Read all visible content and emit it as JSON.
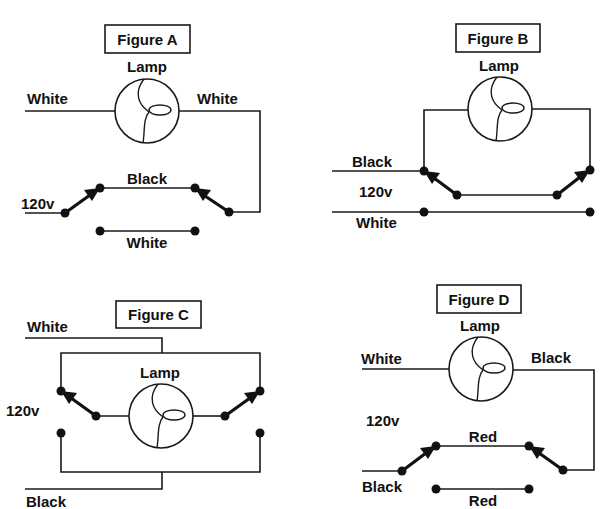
{
  "diagram": {
    "colors": {
      "line": "#1a1a1a",
      "background": "#ffffff"
    },
    "figures": [
      {
        "id": "A",
        "title": "Figure A",
        "lamp_label": "Lamp",
        "labels": {
          "left_top": "White",
          "right_top": "White",
          "top_traveler": "Black",
          "bottom_traveler": "White",
          "supply": "120v"
        }
      },
      {
        "id": "B",
        "title": "Figure B",
        "lamp_label": "Lamp",
        "labels": {
          "hot": "Black",
          "supply": "120v",
          "neutral": "White"
        }
      },
      {
        "id": "C",
        "title": "Figure C",
        "lamp_label": "Lamp",
        "labels": {
          "neutral": "White",
          "supply": "120v",
          "hot": "Black"
        }
      },
      {
        "id": "D",
        "title": "Figure D",
        "lamp_label": "Lamp",
        "labels": {
          "left_top": "White",
          "right_top": "Black",
          "supply": "120v",
          "top_traveler": "Red",
          "hot": "Black",
          "bottom_traveler": "Red"
        }
      }
    ]
  }
}
